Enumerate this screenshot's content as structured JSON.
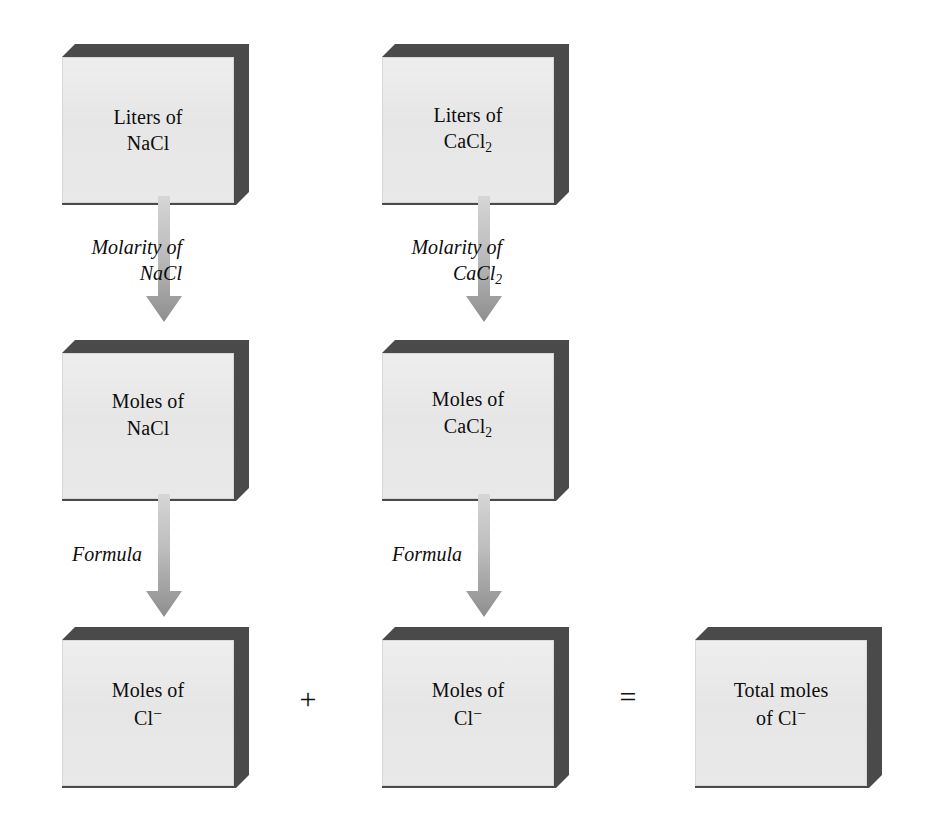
{
  "diagram": {
    "colors": {
      "box_face": "#e8e8e8",
      "box_shadow": "#4a4a4a",
      "arrow_top": "#d9d9d9",
      "arrow_bottom": "#8c8c8c",
      "text": "#0d0d0d",
      "background": "#ffffff"
    },
    "boxes": [
      {
        "id": "liters-nacl",
        "line1": "Liters of",
        "line2": "NaCl",
        "sub": "",
        "charge": ""
      },
      {
        "id": "liters-cacl2",
        "line1": "Liters of",
        "line2": "CaCl",
        "sub": "2",
        "charge": ""
      },
      {
        "id": "moles-nacl",
        "line1": "Moles of",
        "line2": "NaCl",
        "sub": "",
        "charge": ""
      },
      {
        "id": "moles-cacl2",
        "line1": "Moles of",
        "line2": "CaCl",
        "sub": "2",
        "charge": ""
      },
      {
        "id": "moles-cl-left",
        "line1": "Moles of",
        "line2": "Cl",
        "sub": "",
        "charge": "−"
      },
      {
        "id": "moles-cl-mid",
        "line1": "Moles of",
        "line2": "Cl",
        "sub": "",
        "charge": "−"
      },
      {
        "id": "total-moles-cl",
        "line1": "Total moles",
        "line2": "of Cl",
        "sub": "",
        "charge": "−"
      }
    ],
    "arrows": [
      {
        "id": "molarity-nacl",
        "line1": "Molarity of",
        "line2": "NaCl",
        "sub": ""
      },
      {
        "id": "molarity-cacl2",
        "line1": "Molarity of",
        "line2": "CaCl",
        "sub": "2"
      },
      {
        "id": "formula-left",
        "line1": "Formula",
        "line2": "",
        "sub": ""
      },
      {
        "id": "formula-mid",
        "line1": "Formula",
        "line2": "",
        "sub": ""
      }
    ],
    "operators": {
      "plus": "+",
      "equals": "="
    }
  }
}
